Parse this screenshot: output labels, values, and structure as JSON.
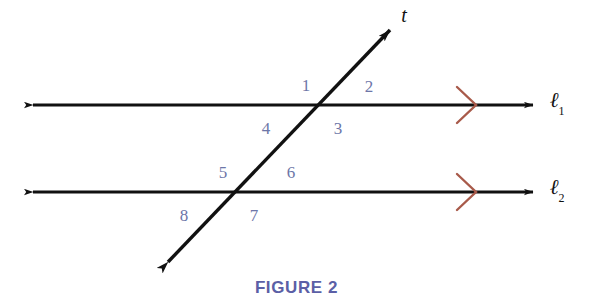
{
  "figure": {
    "caption": "FIGURE 2",
    "background_color": "#ffffff",
    "line_color": "#111111",
    "angle_label_color": "#6d76a8",
    "caption_color": "#5b5fa6",
    "parallel_mark_color": "#a85a4a"
  },
  "lines": {
    "line1": {
      "label": "ℓ",
      "subscript": "1",
      "name": "line-ell-1",
      "y": 105,
      "x_start": 33,
      "x_end": 533,
      "label_x": 557,
      "label_y": 102,
      "parallel_mark_x": 470,
      "arrowheads": "both"
    },
    "line2": {
      "label": "ℓ",
      "subscript": "2",
      "name": "line-ell-2",
      "y": 192,
      "x_start": 33,
      "x_end": 533,
      "label_x": 557,
      "label_y": 189,
      "parallel_mark_x": 470,
      "arrowheads": "both"
    },
    "transversal": {
      "label": "t",
      "name": "transversal-t",
      "x_top": 390,
      "y_top": 30,
      "x_bottom": 168,
      "y_bottom": 262,
      "label_x": 404,
      "label_y": 15,
      "arrowheads": "both"
    }
  },
  "intersections": {
    "upper": {
      "x": 322,
      "y": 105
    },
    "lower": {
      "x": 240,
      "y": 192
    }
  },
  "angles": [
    {
      "id": "angle-1",
      "label": "1",
      "x": 306,
      "y": 85
    },
    {
      "id": "angle-2",
      "label": "2",
      "x": 369,
      "y": 86
    },
    {
      "id": "angle-3",
      "label": "3",
      "x": 338,
      "y": 128
    },
    {
      "id": "angle-4",
      "label": "4",
      "x": 266,
      "y": 128
    },
    {
      "id": "angle-5",
      "label": "5",
      "x": 223,
      "y": 172
    },
    {
      "id": "angle-6",
      "label": "6",
      "x": 291,
      "y": 172
    },
    {
      "id": "angle-7",
      "label": "7",
      "x": 254,
      "y": 215
    },
    {
      "id": "angle-8",
      "label": "8",
      "x": 184,
      "y": 215
    }
  ]
}
